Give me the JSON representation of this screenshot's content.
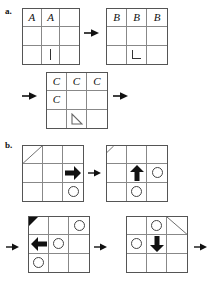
{
  "figure": {
    "title": "",
    "parts": [
      {
        "id": "a",
        "label": "a."
      },
      {
        "id": "b",
        "label": "b."
      }
    ]
  },
  "icons": {
    "arrow_right": "arrow-right-icon",
    "arrow_left": "arrow-left-icon",
    "arrow_up": "arrow-up-icon",
    "arrow_down": "arrow-down-icon",
    "circle": "circle-outline-icon",
    "diagonal": "diagonal-line-icon",
    "corner_triangle": "filled-corner-triangle-icon",
    "triangle_outline": "triangle-outline-icon",
    "tick": "vertical-tick-icon",
    "l_shape": "l-corner-icon",
    "connector": "connector-arrow-icon"
  },
  "colors": {
    "ink": "#111111",
    "grid_outer": "#555555",
    "grid_inner": "#888888",
    "background": "#ffffff"
  },
  "grids": [
    {
      "name": "grid-a-1",
      "part": "a",
      "cells": [
        {
          "r": 0,
          "c": 0,
          "type": "letter",
          "text": "A"
        },
        {
          "r": 0,
          "c": 1,
          "type": "letter",
          "text": "A"
        },
        {
          "r": 0,
          "c": 2,
          "type": "empty",
          "text": ""
        },
        {
          "r": 1,
          "c": 0,
          "type": "empty",
          "text": ""
        },
        {
          "r": 1,
          "c": 1,
          "type": "empty",
          "text": ""
        },
        {
          "r": 1,
          "c": 2,
          "type": "empty",
          "text": ""
        },
        {
          "r": 2,
          "c": 0,
          "type": "empty",
          "text": ""
        },
        {
          "r": 2,
          "c": 1,
          "type": "tick",
          "text": ""
        },
        {
          "r": 2,
          "c": 2,
          "type": "empty",
          "text": ""
        }
      ]
    },
    {
      "name": "grid-a-2",
      "part": "a",
      "cells": [
        {
          "r": 0,
          "c": 0,
          "type": "letter",
          "text": "B"
        },
        {
          "r": 0,
          "c": 1,
          "type": "letter",
          "text": "B"
        },
        {
          "r": 0,
          "c": 2,
          "type": "letter",
          "text": "B"
        },
        {
          "r": 1,
          "c": 0,
          "type": "empty",
          "text": ""
        },
        {
          "r": 1,
          "c": 1,
          "type": "empty",
          "text": ""
        },
        {
          "r": 1,
          "c": 2,
          "type": "empty",
          "text": ""
        },
        {
          "r": 2,
          "c": 0,
          "type": "empty",
          "text": ""
        },
        {
          "r": 2,
          "c": 1,
          "type": "lshape",
          "text": ""
        },
        {
          "r": 2,
          "c": 2,
          "type": "empty",
          "text": ""
        }
      ]
    },
    {
      "name": "grid-a-3",
      "part": "a",
      "cells": [
        {
          "r": 0,
          "c": 0,
          "type": "letter",
          "text": "C"
        },
        {
          "r": 0,
          "c": 1,
          "type": "letter",
          "text": "C"
        },
        {
          "r": 0,
          "c": 2,
          "type": "letter",
          "text": "C"
        },
        {
          "r": 1,
          "c": 0,
          "type": "letter",
          "text": "C"
        },
        {
          "r": 1,
          "c": 1,
          "type": "empty",
          "text": ""
        },
        {
          "r": 1,
          "c": 2,
          "type": "empty",
          "text": ""
        },
        {
          "r": 2,
          "c": 0,
          "type": "empty",
          "text": ""
        },
        {
          "r": 2,
          "c": 1,
          "type": "triangle-outline",
          "text": ""
        },
        {
          "r": 2,
          "c": 2,
          "type": "empty",
          "text": ""
        }
      ]
    },
    {
      "name": "grid-b-1",
      "part": "b",
      "cells": [
        {
          "r": 0,
          "c": 0,
          "type": "diagonal-up",
          "text": ""
        },
        {
          "r": 0,
          "c": 1,
          "type": "empty",
          "text": ""
        },
        {
          "r": 0,
          "c": 2,
          "type": "empty",
          "text": ""
        },
        {
          "r": 1,
          "c": 0,
          "type": "empty",
          "text": ""
        },
        {
          "r": 1,
          "c": 1,
          "type": "empty",
          "text": ""
        },
        {
          "r": 1,
          "c": 2,
          "type": "arrow-right",
          "text": ""
        },
        {
          "r": 2,
          "c": 0,
          "type": "empty",
          "text": ""
        },
        {
          "r": 2,
          "c": 1,
          "type": "empty",
          "text": ""
        },
        {
          "r": 2,
          "c": 2,
          "type": "circle",
          "text": ""
        }
      ]
    },
    {
      "name": "grid-b-2",
      "part": "b",
      "cells": [
        {
          "r": 0,
          "c": 0,
          "type": "corner-diagonal",
          "text": ""
        },
        {
          "r": 0,
          "c": 1,
          "type": "empty",
          "text": ""
        },
        {
          "r": 0,
          "c": 2,
          "type": "empty",
          "text": ""
        },
        {
          "r": 1,
          "c": 0,
          "type": "empty",
          "text": ""
        },
        {
          "r": 1,
          "c": 1,
          "type": "arrow-up",
          "text": ""
        },
        {
          "r": 1,
          "c": 2,
          "type": "circle",
          "text": ""
        },
        {
          "r": 2,
          "c": 0,
          "type": "empty",
          "text": ""
        },
        {
          "r": 2,
          "c": 1,
          "type": "circle",
          "text": ""
        },
        {
          "r": 2,
          "c": 2,
          "type": "empty",
          "text": ""
        }
      ]
    },
    {
      "name": "grid-b-3",
      "part": "b",
      "cells": [
        {
          "r": 0,
          "c": 0,
          "type": "corner-triangle",
          "text": ""
        },
        {
          "r": 0,
          "c": 1,
          "type": "empty",
          "text": ""
        },
        {
          "r": 0,
          "c": 2,
          "type": "circle",
          "text": ""
        },
        {
          "r": 1,
          "c": 0,
          "type": "arrow-left",
          "text": ""
        },
        {
          "r": 1,
          "c": 1,
          "type": "circle",
          "text": ""
        },
        {
          "r": 1,
          "c": 2,
          "type": "empty",
          "text": ""
        },
        {
          "r": 2,
          "c": 0,
          "type": "circle",
          "text": ""
        },
        {
          "r": 2,
          "c": 1,
          "type": "empty",
          "text": ""
        },
        {
          "r": 2,
          "c": 2,
          "type": "empty",
          "text": ""
        }
      ]
    },
    {
      "name": "grid-b-4",
      "part": "b",
      "cells": [
        {
          "r": 0,
          "c": 0,
          "type": "empty",
          "text": ""
        },
        {
          "r": 0,
          "c": 1,
          "type": "circle",
          "text": ""
        },
        {
          "r": 0,
          "c": 2,
          "type": "diagonal-down",
          "text": ""
        },
        {
          "r": 1,
          "c": 0,
          "type": "circle",
          "text": ""
        },
        {
          "r": 1,
          "c": 1,
          "type": "arrow-down",
          "text": ""
        },
        {
          "r": 1,
          "c": 2,
          "type": "empty",
          "text": ""
        },
        {
          "r": 2,
          "c": 0,
          "type": "empty",
          "text": ""
        },
        {
          "r": 2,
          "c": 1,
          "type": "empty",
          "text": ""
        },
        {
          "r": 2,
          "c": 2,
          "type": "empty",
          "text": ""
        }
      ]
    }
  ],
  "connectors": [
    {
      "name": "connector-a-1",
      "direction": "right"
    },
    {
      "name": "connector-a-2-in",
      "direction": "right"
    },
    {
      "name": "connector-a-2-out",
      "direction": "right"
    },
    {
      "name": "connector-b-1",
      "direction": "right"
    },
    {
      "name": "connector-b-2-in",
      "direction": "right"
    },
    {
      "name": "connector-b-2-mid",
      "direction": "right"
    },
    {
      "name": "connector-b-2-out",
      "direction": "right"
    }
  ]
}
